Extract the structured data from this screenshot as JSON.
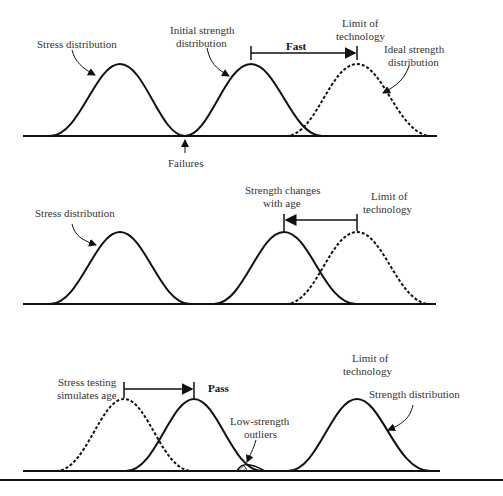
{
  "panels": [
    {
      "name": "fast",
      "labels": {
        "stress": "Stress distribution",
        "initial_strength_1": "Initial strength",
        "initial_strength_2": "distribution",
        "limit_1": "Limit of",
        "limit_2": "technology",
        "ideal_1": "Ideal strength",
        "ideal_2": "distribution",
        "shift": "Fast",
        "failures": "Failures"
      }
    },
    {
      "name": "aging",
      "labels": {
        "stress": "Stress distribution",
        "changes_1": "Strength changes",
        "changes_2": "with age",
        "limit_1": "Limit of",
        "limit_2": "technology"
      }
    },
    {
      "name": "pass",
      "labels": {
        "stress_testing_1": "Stress testing",
        "stress_testing_2": "simulates age",
        "shift": "Pass",
        "outliers_1": "Low-strength",
        "outliers_2": "outliers",
        "limit_1": "Limit of",
        "limit_2": "technology",
        "strength": "Strength distribution"
      }
    }
  ],
  "caption": "",
  "colors": {
    "line": "#111111",
    "text": "#333333"
  }
}
